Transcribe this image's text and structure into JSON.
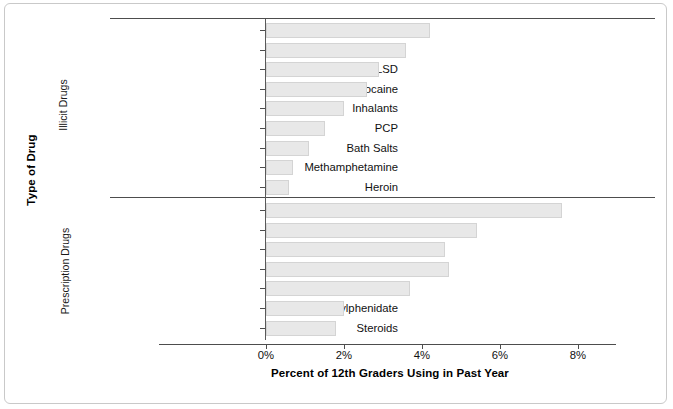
{
  "chart_data": {
    "type": "bar",
    "orientation": "horizontal",
    "title": "",
    "xlabel": "Percent of 12th Graders Using in Past Year",
    "ylabel": "Type of Drug",
    "xlim": [
      0,
      8.2
    ],
    "xticks": [
      0,
      2,
      4,
      6,
      8
    ],
    "xticklabels": [
      "0%",
      "2%",
      "4%",
      "6%",
      "8%"
    ],
    "grid": false,
    "legend": null,
    "bar_fill": "#e8e8e8",
    "bar_stroke": "#d4d4d4",
    "groups": [
      {
        "name": "Illicit Drugs",
        "categories": [
          "Hallucinogens",
          "MDMA",
          "LSD",
          "Cocaine",
          "Inhalants",
          "PCP",
          "Bath Salts",
          "Methamphetamine",
          "Heroin"
        ],
        "values": [
          4.2,
          3.6,
          2.9,
          2.6,
          2.0,
          1.5,
          1.1,
          0.7,
          0.6
        ]
      },
      {
        "name": "Prescription Drugs",
        "categories": [
          "Amphetamine",
          "Prescription Narcotics",
          "Cough Medicine",
          "Tranquilizers",
          "Sedatives",
          "Methylphenidate",
          "Steroids"
        ],
        "values": [
          7.6,
          5.4,
          4.6,
          4.7,
          3.7,
          2.0,
          1.8
        ]
      }
    ]
  }
}
